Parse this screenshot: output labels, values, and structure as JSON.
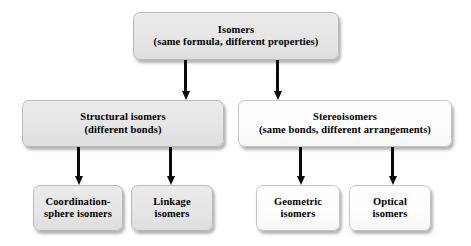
{
  "diagram": {
    "type": "hierarchy-flowchart",
    "background_color": "#ffffff",
    "arrow_color": "#0a0a0a",
    "node_fill_gray": "#e6e6e6",
    "node_fill_white": "#ffffff",
    "node_border_color": "#b9b9b9",
    "text_color": "#000000"
  },
  "nodes": {
    "root": {
      "title": "Isomers",
      "subtitle": "(same formula, different properties)",
      "text": "Isomers\n(same formula, different properties)",
      "level": 0,
      "fill": "gray"
    },
    "structural": {
      "title": "Structural isomers",
      "subtitle": "(different bonds)",
      "text": "Structural isomers\n(different bonds)",
      "level": 1,
      "fill": "gray"
    },
    "stereo": {
      "title": "Stereoisomers",
      "subtitle": "(same bonds, different arrangements)",
      "text": "Stereoisomers\n(same bonds, different arrangements)",
      "level": 1,
      "fill": "white"
    },
    "coordination": {
      "title": "Coordination-sphere isomers",
      "text": "Coordination-\nsphere isomers",
      "level": 2,
      "fill": "gray"
    },
    "linkage": {
      "title": "Linkage isomers",
      "text": "Linkage\nisomers",
      "level": 2,
      "fill": "gray"
    },
    "geometric": {
      "title": "Geometric isomers",
      "text": "Geometric\nisomers",
      "level": 2,
      "fill": "white"
    },
    "optical": {
      "title": "Optical isomers",
      "text": "Optical\nisomers",
      "level": 2,
      "fill": "white"
    }
  },
  "edges": [
    {
      "from": "root",
      "to": "structural",
      "style": "arrow-down"
    },
    {
      "from": "root",
      "to": "stereo",
      "style": "arrow-down"
    },
    {
      "from": "structural",
      "to": "coordination",
      "style": "arrow-down"
    },
    {
      "from": "structural",
      "to": "linkage",
      "style": "arrow-down"
    },
    {
      "from": "stereo",
      "to": "geometric",
      "style": "arrow-down"
    },
    {
      "from": "stereo",
      "to": "optical",
      "style": "arrow-down"
    }
  ]
}
